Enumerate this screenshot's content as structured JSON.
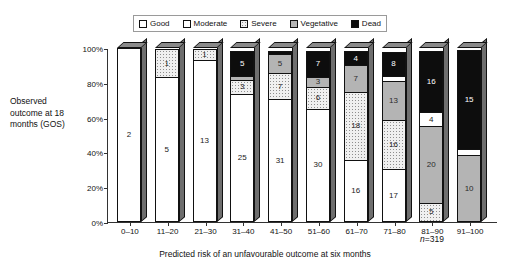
{
  "chart_data": {
    "type": "bar",
    "subtype": "stacked-percentage-bar",
    "title": "",
    "xlabel": "Predicted risk of an unfavourable outcome at six months",
    "ylabel": "Observed outcome at 18 months (GOS)",
    "annotation": "n=319",
    "annotation_prefix": "n",
    "annotation_value": "=319",
    "ylim": [
      0,
      100
    ],
    "ytick_labels": [
      "0%",
      "20%",
      "40%",
      "60%",
      "80%",
      "100%"
    ],
    "ytick_values": [
      0,
      20,
      40,
      60,
      80,
      100
    ],
    "grid": false,
    "legend_position": "top-center",
    "categories": [
      "0–10",
      "11–20",
      "21–30",
      "31–40",
      "41–50",
      "51–60",
      "61–70",
      "71–80",
      "81–90",
      "91–100"
    ],
    "series": [
      {
        "name": "Good",
        "color": "#ffffff",
        "values": [
          2,
          5,
          13,
          25,
          31,
          30,
          16,
          17,
          0,
          0
        ]
      },
      {
        "name": "Moderate",
        "color": "#ffffff",
        "values": [
          0,
          0,
          0,
          0,
          0,
          0,
          0,
          0,
          0,
          0
        ]
      },
      {
        "name": "Severe",
        "color": "#f0f0f0",
        "values": [
          0,
          1,
          1,
          3,
          7,
          6,
          18,
          16,
          5,
          0
        ]
      },
      {
        "name": "Vegetative",
        "color": "#b4b4b4",
        "values": [
          0,
          0,
          0,
          1,
          5,
          3,
          7,
          13,
          20,
          10
        ]
      },
      {
        "name": "Dead",
        "color": "#0d0d0d",
        "values": [
          0,
          0,
          0,
          5,
          1,
          7,
          4,
          8,
          16,
          15
        ]
      }
    ],
    "extra_segments": [
      {
        "category": "71–80",
        "series": "Moderate",
        "value": 2
      },
      {
        "category": "81–90",
        "series": "Moderate",
        "value": 4
      },
      {
        "category": "91–100",
        "series": "Moderate",
        "value": 1
      }
    ],
    "bars": [
      {
        "label": "0–10",
        "total": 2,
        "segments": [
          {
            "name": "Good",
            "value": 2,
            "show": true
          }
        ]
      },
      {
        "label": "11–20",
        "total": 6,
        "segments": [
          {
            "name": "Good",
            "value": 5,
            "show": true
          },
          {
            "name": "Severe",
            "value": 1,
            "show": true
          }
        ]
      },
      {
        "label": "21–30",
        "total": 14,
        "segments": [
          {
            "name": "Good",
            "value": 13,
            "show": true
          },
          {
            "name": "Severe",
            "value": 1,
            "show": true
          }
        ]
      },
      {
        "label": "31–40",
        "total": 34,
        "segments": [
          {
            "name": "Good",
            "value": 25,
            "show": true
          },
          {
            "name": "Severe",
            "value": 3,
            "show": true
          },
          {
            "name": "Vegetative",
            "value": 1,
            "show": true
          },
          {
            "name": "Dead",
            "value": 5,
            "show": true
          }
        ]
      },
      {
        "label": "41–50",
        "total": 44,
        "segments": [
          {
            "name": "Good",
            "value": 31,
            "show": true
          },
          {
            "name": "Severe",
            "value": 7,
            "show": true
          },
          {
            "name": "Vegetative",
            "value": 5,
            "show": true
          },
          {
            "name": "Dead",
            "value": 1,
            "show": true
          }
        ]
      },
      {
        "label": "51–60",
        "total": 46,
        "segments": [
          {
            "name": "Good",
            "value": 30,
            "show": true
          },
          {
            "name": "Severe",
            "value": 6,
            "show": true
          },
          {
            "name": "Vegetative",
            "value": 3,
            "show": true
          },
          {
            "name": "Dead",
            "value": 7,
            "show": true
          }
        ]
      },
      {
        "label": "61–70",
        "total": 45,
        "segments": [
          {
            "name": "Good",
            "value": 16,
            "show": true
          },
          {
            "name": "Severe",
            "value": 18,
            "show": true
          },
          {
            "name": "Vegetative",
            "value": 7,
            "show": true
          },
          {
            "name": "Dead",
            "value": 4,
            "show": true
          }
        ]
      },
      {
        "label": "71–80",
        "total": 56,
        "segments": [
          {
            "name": "Good",
            "value": 17,
            "show": true
          },
          {
            "name": "Severe",
            "value": 16,
            "show": true
          },
          {
            "name": "Vegetative",
            "value": 13,
            "show": true
          },
          {
            "name": "Moderate",
            "value": 2,
            "show": true
          },
          {
            "name": "Dead",
            "value": 8,
            "show": true
          }
        ]
      },
      {
        "label": "81–90",
        "total": 45,
        "segments": [
          {
            "name": "Severe",
            "value": 5,
            "show": true
          },
          {
            "name": "Vegetative",
            "value": 20,
            "show": true
          },
          {
            "name": "Moderate",
            "value": 4,
            "show": true
          },
          {
            "name": "Dead",
            "value": 16,
            "show": true
          }
        ]
      },
      {
        "label": "91–100",
        "total": 26,
        "segments": [
          {
            "name": "Vegetative",
            "value": 10,
            "show": true
          },
          {
            "name": "Moderate",
            "value": 1,
            "show": true
          },
          {
            "name": "Dead",
            "value": 15,
            "show": true
          }
        ]
      }
    ]
  },
  "legend": {
    "items": [
      {
        "label": "Good",
        "swatch": "swatch-good"
      },
      {
        "label": "Moderate",
        "swatch": "swatch-moderate"
      },
      {
        "label": "Severe",
        "swatch": "swatch-severe"
      },
      {
        "label": "Vegetative",
        "swatch": "swatch-vegetative"
      },
      {
        "label": "Dead",
        "swatch": "swatch-dead"
      }
    ]
  }
}
